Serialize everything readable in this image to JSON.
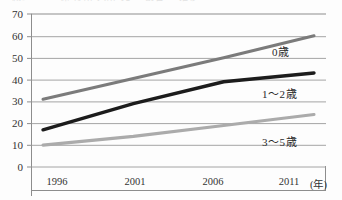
{
  "top_remnant": {
    "text": "減少 　　 保 育所 入所 児　 割合　 推移"
  },
  "chart_data": {
    "type": "line",
    "title": "",
    "subtitle": "",
    "xlabel": "",
    "ylabel": "",
    "x": [
      "1996",
      "2001",
      "2006",
      "2011"
    ],
    "categories": [
      "1996",
      "2001",
      "2006",
      "2011"
    ],
    "xunit": "(年)",
    "xlim": [
      1996,
      2011
    ],
    "ylim": [
      0,
      70
    ],
    "yticks": [
      0,
      10,
      20,
      30,
      40,
      50,
      60,
      70
    ],
    "xticks": [
      "1996",
      "2001",
      "2006",
      "2011"
    ],
    "grid": true,
    "grid_axis": "y",
    "legend": "inline-labels",
    "series": [
      {
        "name": "0歳",
        "values": [
          31,
          40.5,
          50,
          60
        ],
        "color": "#7b7b7b",
        "label_value": "0歳"
      },
      {
        "name": "1～2歳",
        "values": [
          17,
          29,
          39,
          43
        ],
        "color": "#1c1c1c",
        "label_value": "1～2歳"
      },
      {
        "name": "3～5歳",
        "values": [
          10,
          14,
          19,
          24
        ],
        "color": "#ababab",
        "label_value": "3～5歳"
      }
    ]
  },
  "axis": {
    "yticks": [
      {
        "label": "70"
      },
      {
        "label": "60"
      },
      {
        "label": "50"
      },
      {
        "label": "40"
      },
      {
        "label": "30"
      },
      {
        "label": "20"
      },
      {
        "label": "10"
      },
      {
        "label": "0"
      }
    ],
    "xticks": [
      {
        "label": "1996"
      },
      {
        "label": "2001"
      },
      {
        "label": "2006"
      },
      {
        "label": "2011"
      }
    ],
    "unit": "(年)"
  },
  "series_labels": [
    {
      "text": "0歳"
    },
    {
      "text": "1～2歳"
    },
    {
      "text": "3～5歳"
    }
  ],
  "colors": {
    "series_0": "#7b7b7b",
    "series_1": "#1c1c1c",
    "series_2": "#ababab",
    "grid": "#9a9a9a",
    "axis": "#8d8d8d",
    "text": "#2b2b2b",
    "background": "#fdfdfd"
  }
}
